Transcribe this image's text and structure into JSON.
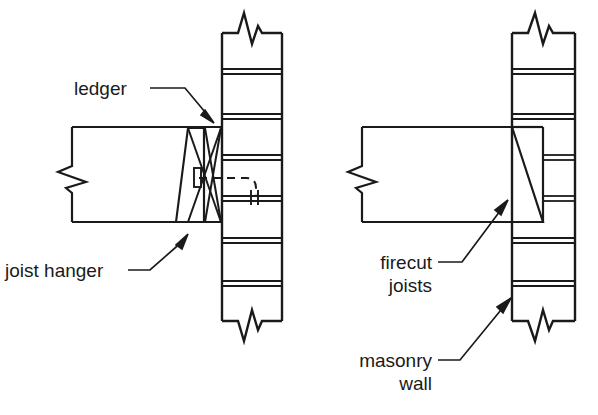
{
  "figure": {
    "kind": "construction-detail-drawing",
    "background_color": "#ffffff",
    "line_color": "#1a1a1a",
    "width": 598,
    "height": 415
  },
  "labels": {
    "ledger": "ledger",
    "joist_hanger": "joist hanger",
    "firecut_joists_line1": "firecut",
    "firecut_joists_line2": "joists",
    "masonry_wall_line1": "masonry",
    "masonry_wall_line2": "wall"
  },
  "details": [
    {
      "id": "left-detail",
      "name": "ledger-and-joist-hanger-detail",
      "callouts": [
        "ledger",
        "joist hanger"
      ]
    },
    {
      "id": "right-detail",
      "name": "firecut-joist-detail",
      "callouts": [
        "firecut joists",
        "masonry wall"
      ]
    }
  ],
  "components": {
    "masonry_wall": "masonry wall section with coursing joints",
    "joist": "horizontal wood joist in section",
    "break_symbol": "zigzag break line",
    "hanger_strap": "metal joist hanger strap",
    "anchor": "dashed hidden anchor bolt"
  }
}
